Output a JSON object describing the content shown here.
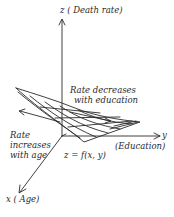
{
  "diagram": {
    "z_axis_label": "z ( Death rate)",
    "y_axis_label": "y",
    "y_axis_desc": "(Education)",
    "x_axis_label": "x ( Age)",
    "function_label": "z = f(x, y)",
    "annotation_education_line1": "Rate decreases",
    "annotation_education_line2": "with education",
    "annotation_age_line1": "Rate",
    "annotation_age_line2": "increases",
    "annotation_age_line3": "with age"
  },
  "colors": {
    "ink": "#2a2a2a",
    "background": "#ffffff"
  }
}
